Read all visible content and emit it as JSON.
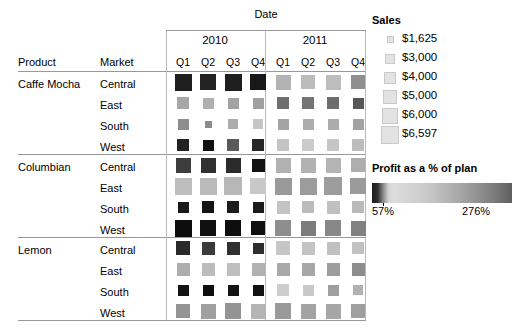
{
  "header": {
    "date_label": "Date",
    "product_label": "Product",
    "market_label": "Market",
    "years": [
      "2010",
      "2011"
    ],
    "quarters": [
      "Q1",
      "Q2",
      "Q3",
      "Q4",
      "Q1",
      "Q2",
      "Q3",
      "Q4"
    ]
  },
  "legend": {
    "sales_title": "Sales",
    "sales_items": [
      {
        "label": "$1,625",
        "size": 7
      },
      {
        "label": "$3,000",
        "size": 10
      },
      {
        "label": "$4,000",
        "size": 12
      },
      {
        "label": "$5,000",
        "size": 14
      },
      {
        "label": "$6,000",
        "size": 16
      },
      {
        "label": "$6,597",
        "size": 18
      }
    ],
    "profit_title": "Profit as a % of plan",
    "profit_min": "57%",
    "profit_max": "276%"
  },
  "chart_data": {
    "type": "heatmap",
    "title": "Date",
    "xlabel": "Date",
    "ylabel": "Product / Market",
    "grid": true,
    "legend_position": "right",
    "columns": [
      "2010 Q1",
      "2010 Q2",
      "2010 Q3",
      "2010 Q4",
      "2011 Q1",
      "2011 Q2",
      "2011 Q3",
      "2011 Q4"
    ],
    "size_encoding": "Sales",
    "color_encoding": "Profit as a % of plan",
    "size_range": [
      1625,
      6597
    ],
    "color_range": [
      57,
      276
    ],
    "rows": [
      {
        "product": "Caffe Mocha",
        "market": "Central",
        "sizes": [
          17,
          16,
          17,
          16,
          15,
          14,
          15,
          14
        ],
        "colors": [
          "#1e1e1e",
          "#232323",
          "#1f1f1f",
          "#181818",
          "#b3b3b3",
          "#bcbcbc",
          "#bdbdbd",
          "#8f8f8f"
        ]
      },
      {
        "product": "Caffe Mocha",
        "market": "East",
        "sizes": [
          12,
          11,
          11,
          11,
          12,
          12,
          12,
          11
        ],
        "colors": [
          "#a6a6a6",
          "#b0b0b0",
          "#a3a3a3",
          "#a0a0a0",
          "#6e6e6e",
          "#747474",
          "#6d6d6d",
          "#575757"
        ]
      },
      {
        "product": "Caffe Mocha",
        "market": "South",
        "sizes": [
          11,
          7,
          10,
          10,
          11,
          11,
          11,
          11
        ],
        "colors": [
          "#8e8e8e",
          "#8b8b8b",
          "#acacac",
          "#c6c6c6",
          "#a4a4a4",
          "#adadad",
          "#acacac",
          "#a2a2a2"
        ]
      },
      {
        "product": "Caffe Mocha",
        "market": "West",
        "sizes": [
          12,
          11,
          12,
          12,
          12,
          12,
          12,
          12
        ],
        "colors": [
          "#222222",
          "#111111",
          "#5a5a5a",
          "#262626",
          "#c4c4c4",
          "#cbcbcb",
          "#c6c6c6",
          "#bdbdbd"
        ]
      },
      {
        "product": "Columbian",
        "market": "Central",
        "sizes": [
          15,
          15,
          15,
          13,
          15,
          15,
          15,
          14
        ],
        "colors": [
          "#3d3d3d",
          "#303030",
          "#2b2b2b",
          "#121212",
          "#b1b1b1",
          "#b2b2b2",
          "#b4b4b4",
          "#aeaeae"
        ]
      },
      {
        "product": "Columbian",
        "market": "East",
        "sizes": [
          17,
          17,
          18,
          16,
          17,
          17,
          18,
          16
        ],
        "colors": [
          "#bebebe",
          "#bababa",
          "#b7b7b7",
          "#c8c8c8",
          "#9a9a9a",
          "#9c9c9c",
          "#9d9d9d",
          "#9b9b9b"
        ]
      },
      {
        "product": "Columbian",
        "market": "South",
        "sizes": [
          11,
          12,
          12,
          11,
          13,
          12,
          13,
          12
        ],
        "colors": [
          "#191919",
          "#141414",
          "#1d1d1d",
          "#1b1b1b",
          "#c3c3c3",
          "#bcbcbc",
          "#c0c0c0",
          "#bababa"
        ]
      },
      {
        "product": "Columbian",
        "market": "West",
        "sizes": [
          17,
          16,
          16,
          14,
          16,
          15,
          16,
          15
        ],
        "colors": [
          "#0d0d0d",
          "#101010",
          "#0e0e0e",
          "#101010",
          "#8e8e8e",
          "#7c7c7c",
          "#888888",
          "#818181"
        ]
      },
      {
        "product": "Lemon",
        "market": "Central",
        "sizes": [
          14,
          13,
          13,
          11,
          14,
          13,
          13,
          12
        ],
        "colors": [
          "#2a2a2a",
          "#3a3a3a",
          "#303030",
          "#2e2e2e",
          "#c6c6c6",
          "#c3c3c3",
          "#c0c0c0",
          "#c1c1c1"
        ]
      },
      {
        "product": "Lemon",
        "market": "East",
        "sizes": [
          13,
          13,
          13,
          13,
          13,
          13,
          13,
          13
        ],
        "colors": [
          "#adadad",
          "#bcbcbc",
          "#bfbfbf",
          "#b1b1b1",
          "#a9a9a9",
          "#a7a7a7",
          "#9d9d9d",
          "#8d8d8d"
        ]
      },
      {
        "product": "Lemon",
        "market": "South",
        "sizes": [
          11,
          11,
          11,
          11,
          12,
          11,
          11,
          10
        ],
        "colors": [
          "#131313",
          "#0f0f0f",
          "#141414",
          "#121212",
          "#cdcdcd",
          "#c8c8c8",
          "#9f9f9f",
          "#b1b1b1"
        ]
      },
      {
        "product": "Lemon",
        "market": "West",
        "sizes": [
          14,
          15,
          16,
          15,
          16,
          15,
          15,
          14
        ],
        "colors": [
          "#949494",
          "#a0a0a0",
          "#949494",
          "#b5b5b5",
          "#9a9a9a",
          "#a3a3a3",
          "#a6a6a6",
          "#9f9f9f"
        ]
      }
    ]
  }
}
